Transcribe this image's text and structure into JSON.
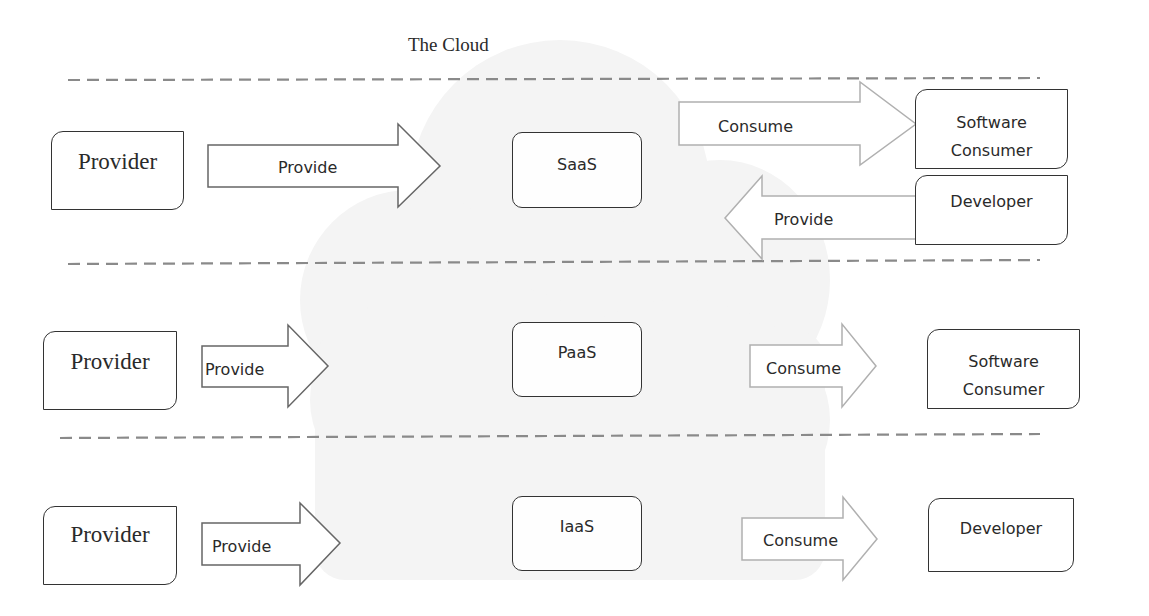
{
  "title": "The Cloud",
  "layers": [
    {
      "service": "SaaS",
      "provider": {
        "label": "Provider",
        "arrow_label": "Provide"
      },
      "consumers": [
        {
          "label": "Software Consumer",
          "line1": "Software",
          "line2": "Consumer",
          "arrow_label": "Consume",
          "direction": "out"
        },
        {
          "label": "Developer",
          "arrow_label": "Provide",
          "direction": "in"
        }
      ]
    },
    {
      "service": "PaaS",
      "provider": {
        "label": "Provider",
        "arrow_label": "Provide"
      },
      "consumers": [
        {
          "label": "Software Consumer",
          "line1": "Software",
          "line2": "Consumer",
          "arrow_label": "Consume",
          "direction": "out"
        }
      ]
    },
    {
      "service": "IaaS",
      "provider": {
        "label": "Provider",
        "arrow_label": "Provide"
      },
      "consumers": [
        {
          "label": "Developer",
          "arrow_label": "Consume",
          "direction": "out"
        }
      ]
    }
  ],
  "colors": {
    "cloud_fill": "#f3f3f3",
    "box_border": "#333333",
    "arrow_stroke_dark": "#555555",
    "arrow_stroke_light": "#aaaaaa",
    "divider": "#8a8a8a"
  }
}
